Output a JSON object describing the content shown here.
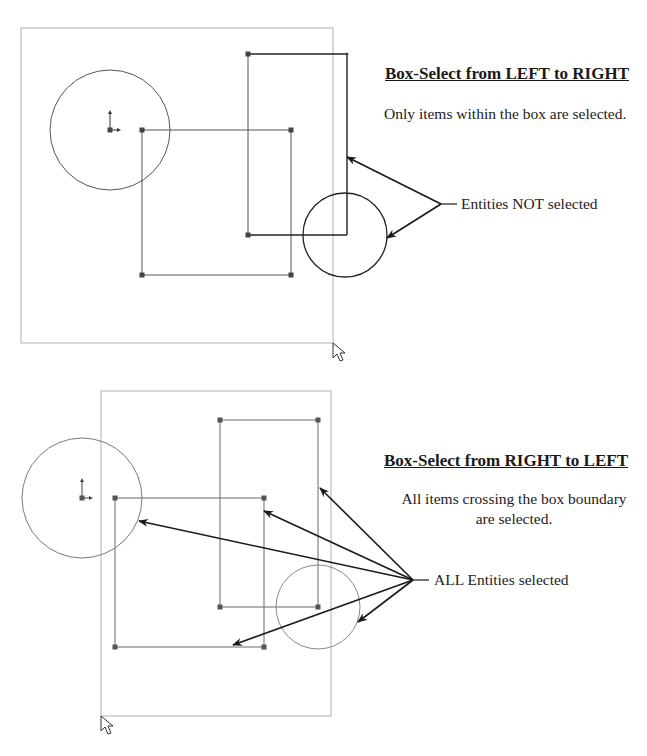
{
  "top_panel": {
    "heading": "Box-Select from LEFT to RIGHT",
    "description": "Only items within the box are selected.",
    "callout": "Entities NOT selected",
    "selection_box": {
      "x1": 21,
      "y1": 28,
      "x2": 333,
      "y2": 343
    },
    "entities": {
      "circle_left": {
        "cx": 110,
        "cy": 130,
        "r": 60
      },
      "rect_square": {
        "x1": 142,
        "y1": 130,
        "x2": 291,
        "y2": 275
      },
      "rect_tall": {
        "x1": 248,
        "y1": 54,
        "x2": 347,
        "y2": 235
      },
      "circle_right": {
        "cx": 345,
        "cy": 235,
        "r": 42
      }
    },
    "arrow_origin": {
      "x": 441,
      "y": 204
    },
    "arrow_targets": [
      {
        "x": 347,
        "y": 157
      },
      {
        "x": 387,
        "y": 238
      }
    ],
    "cursor": {
      "x": 333,
      "y": 343
    },
    "origin_marker": {
      "x": 110,
      "y": 130
    }
  },
  "bottom_panel": {
    "heading": "Box-Select from RIGHT to LEFT",
    "description_line1": "All items crossing the box boundary",
    "description_line2": "are selected.",
    "callout": "ALL Entities selected",
    "selection_box": {
      "x1": 101,
      "y1": 391,
      "x2": 331,
      "y2": 716
    },
    "entities": {
      "circle_left": {
        "cx": 82,
        "cy": 498,
        "r": 60
      },
      "rect_square": {
        "x1": 115,
        "y1": 498,
        "x2": 264,
        "y2": 647
      },
      "rect_tall": {
        "x1": 220,
        "y1": 420,
        "x2": 318,
        "y2": 607
      },
      "circle_right": {
        "cx": 318,
        "cy": 607,
        "r": 42
      }
    },
    "arrow_origin": {
      "x": 413,
      "y": 580
    },
    "arrow_targets": [
      {
        "x": 320,
        "y": 488
      },
      {
        "x": 264,
        "y": 511
      },
      {
        "x": 139,
        "y": 521
      },
      {
        "x": 233,
        "y": 645
      },
      {
        "x": 358,
        "y": 622
      }
    ],
    "cursor": {
      "x": 101,
      "y": 716
    },
    "origin_marker": {
      "x": 82,
      "y": 498
    }
  },
  "colors": {
    "selection_box": "#b0b0b0",
    "entity_unselected": "#333333",
    "entity_selected": "#7a7a7a",
    "arrow": "#1a1a1a",
    "text": "#1a1a1a"
  }
}
